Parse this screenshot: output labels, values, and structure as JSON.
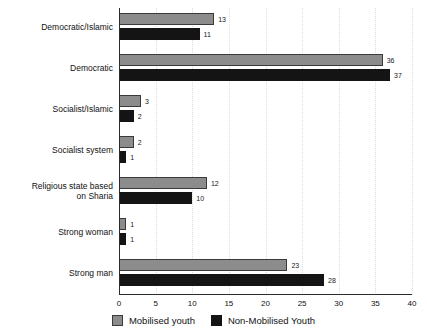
{
  "chart_data": {
    "type": "bar",
    "orientation": "horizontal",
    "title": "",
    "subtitle": "",
    "xlabel": "",
    "ylabel": "",
    "xlim": [
      0,
      40
    ],
    "xticks": [
      0,
      5,
      10,
      15,
      20,
      25,
      30,
      35,
      40
    ],
    "grid": "vertical-dotted",
    "legend_position": "bottom-center",
    "categories": [
      "Democratic/Islamic",
      "Democratic",
      "Socialist/Islamic",
      "Socialist system",
      "Religious state based\non Sharia",
      "Strong woman",
      "Strong man"
    ],
    "series": [
      {
        "name": "Mobilised youth",
        "color": "#8c8c8c",
        "values": [
          13,
          36,
          3,
          2,
          12,
          1,
          23
        ]
      },
      {
        "name": "Non-Mobilised Youth",
        "color": "#141414",
        "values": [
          11,
          37,
          2,
          1,
          10,
          1,
          28
        ]
      }
    ],
    "value_labels": {
      "series_0": [
        "13",
        "36",
        "3",
        "2",
        "12",
        "1",
        "23"
      ],
      "series_1": [
        "11",
        "37",
        "2",
        "1",
        "10",
        "1",
        "28"
      ]
    }
  },
  "legend": {
    "items": [
      {
        "label": "Mobilised youth",
        "swatch": "gray"
      },
      {
        "label": "Non-Mobilised Youth",
        "swatch": "black"
      }
    ]
  },
  "axis": {
    "tick_labels": [
      "0",
      "5",
      "10",
      "15",
      "20",
      "25",
      "30",
      "35",
      "40"
    ]
  }
}
